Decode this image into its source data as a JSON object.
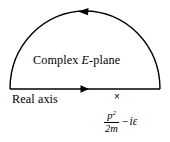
{
  "figure": {
    "background_color": "#ffffff",
    "line_color": "#000000",
    "plane_label": {
      "prefix": "Complex ",
      "symbol": "E",
      "suffix": "-plane"
    },
    "axis_label": "Real axis",
    "pole": {
      "marker": "×",
      "numerator": "p",
      "numerator_exponent": "2",
      "denominator": "2m",
      "operator": "−",
      "imaginary_term": "iε",
      "full_text": "p²/2m − iε"
    },
    "arrows": {
      "arc_arrow_direction": "left",
      "axis_arrow_direction": "right"
    }
  }
}
